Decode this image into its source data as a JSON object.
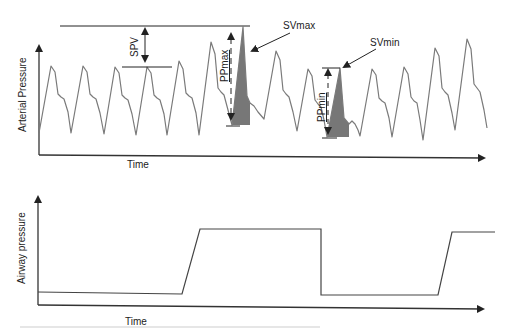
{
  "top_panel": {
    "y_label": "Arterial Pressure",
    "x_label": "Time",
    "annotations": {
      "spv": "SPV",
      "pp_max": "PPmax",
      "sv_max": "SVmax",
      "pp_min": "PPmin",
      "sv_min": "SVmin"
    }
  },
  "bottom_panel": {
    "y_label": "Airway pressure",
    "x_label": "Time"
  },
  "colors": {
    "waveform": "#7a7a7a",
    "axis": "#333333",
    "shaded_area": "#777777"
  }
}
